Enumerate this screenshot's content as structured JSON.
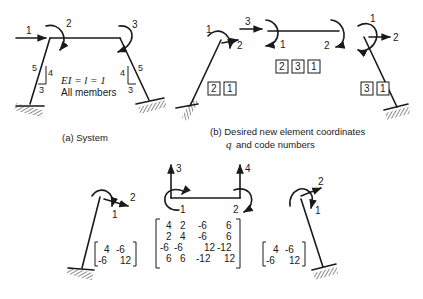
{
  "panel_a": {
    "caption": "(a) System",
    "property_line1": "EI = l = 1",
    "property_line2": "All members",
    "coordinates": {
      "c1": "1",
      "c2": "2",
      "c3": "3"
    },
    "slope_left": {
      "hyp": "5",
      "rise": "4",
      "run": "3"
    },
    "slope_right": {
      "hyp": "5",
      "rise": "4",
      "run": "3"
    }
  },
  "panel_b": {
    "caption_line1": "(b) Desired new element coordinates",
    "caption_q": "q",
    "caption_line2": "and code numbers",
    "left_member": {
      "coord_1": "1",
      "coord_2": "2",
      "codes": [
        "2",
        "1"
      ]
    },
    "beam": {
      "coord_1": "1",
      "coord_2": "2",
      "coord_3": "3",
      "codes": [
        "2",
        "3",
        "1"
      ]
    },
    "right_member": {
      "coord_1": "1",
      "coord_2": "2",
      "codes": [
        "3",
        "1"
      ]
    }
  },
  "panel_c": {
    "left_column": {
      "coord_1": "1",
      "coord_2": "2",
      "matrix": [
        [
          "4",
          "-6"
        ],
        [
          "-6",
          "12"
        ]
      ]
    },
    "beam": {
      "coord_1": "1",
      "coord_2": "2",
      "coord_3": "3",
      "coord_4": "4",
      "matrix": [
        [
          "4",
          "2",
          "-6",
          "6"
        ],
        [
          "2",
          "4",
          "-6",
          "6"
        ],
        [
          "-6",
          "-6",
          "12",
          "-12"
        ],
        [
          "6",
          "6",
          "-12",
          "12"
        ]
      ]
    },
    "right_column": {
      "coord_1": "1",
      "coord_2": "2",
      "matrix": [
        [
          "4",
          "-6"
        ],
        [
          "-6",
          "12"
        ]
      ]
    }
  }
}
